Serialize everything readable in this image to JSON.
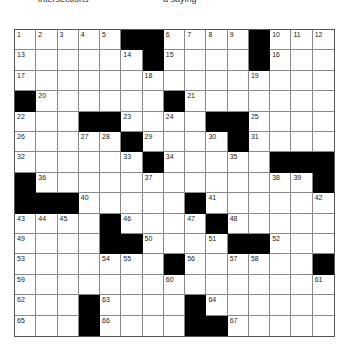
{
  "header": {
    "left_text": "intersections",
    "right_text": "a saying"
  },
  "puzzle": {
    "rows": 15,
    "cols": 15,
    "colors": {
      "block": "#000000",
      "cell": "#ffffff",
      "grid_line": "#8a8a8a"
    },
    "grid": [
      [
        "1",
        "2",
        "3",
        "4",
        "5",
        "#",
        "#",
        "6",
        "7",
        "8",
        "9",
        "#",
        "10",
        "11",
        "12"
      ],
      [
        "13",
        "",
        "",
        "",
        "",
        "14",
        "#",
        "15",
        "",
        "",
        "",
        "#",
        "16",
        "",
        ""
      ],
      [
        "17",
        "",
        "",
        "",
        "",
        "",
        "18",
        "",
        "",
        "",
        "",
        "19",
        "",
        "",
        ""
      ],
      [
        "#",
        "20",
        "",
        "",
        "",
        "",
        "",
        "#",
        "21",
        "",
        "",
        "",
        "",
        "",
        ""
      ],
      [
        "22",
        "",
        "",
        "#",
        "#",
        "23",
        "",
        "24",
        "",
        "#",
        "#",
        "25",
        "",
        "",
        ""
      ],
      [
        "26",
        "",
        "",
        "27",
        "28",
        "#",
        "29",
        "",
        "",
        "30",
        "#",
        "31",
        "",
        "",
        ""
      ],
      [
        "32",
        "",
        "",
        "",
        "",
        "33",
        "#",
        "34",
        "",
        "",
        "35",
        "",
        "#",
        "#",
        "#"
      ],
      [
        "#",
        "36",
        "",
        "",
        "",
        "",
        "37",
        "",
        "",
        "",
        "",
        "",
        "38",
        "39",
        "#"
      ],
      [
        "#",
        "#",
        "#",
        "40",
        "",
        "",
        "",
        "",
        "#",
        "41",
        "",
        "",
        "",
        "",
        "42"
      ],
      [
        "43",
        "44",
        "45",
        "",
        "#",
        "46",
        "",
        "",
        "47",
        "#",
        "48",
        "",
        "",
        "",
        ""
      ],
      [
        "49",
        "",
        "",
        "",
        "#",
        "#",
        "50",
        "",
        "",
        "51",
        "#",
        "#",
        "52",
        "",
        ""
      ],
      [
        "53",
        "",
        "",
        "",
        "54",
        "55",
        "",
        "#",
        "56",
        "",
        "57",
        "58",
        "",
        "",
        "#"
      ],
      [
        "59",
        "",
        "",
        "",
        "",
        "",
        "",
        "60",
        "",
        "",
        "",
        "",
        "",
        "",
        "61"
      ],
      [
        "62",
        "",
        "",
        "#",
        "63",
        "",
        "",
        "",
        "#",
        "64",
        "",
        "",
        "",
        "",
        ""
      ],
      [
        "65",
        "",
        "",
        "#",
        "66",
        "",
        "",
        "",
        "#",
        "#",
        "67",
        "",
        "",
        "",
        ""
      ]
    ]
  }
}
